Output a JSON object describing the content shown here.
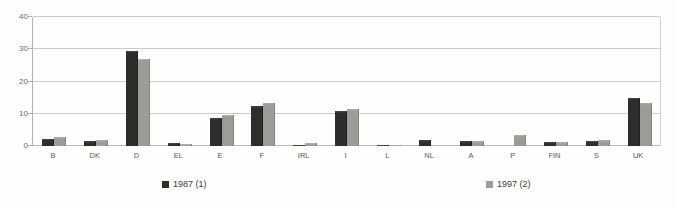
{
  "chart_data": {
    "type": "bar",
    "title": "",
    "xlabel": "",
    "ylabel": "",
    "categories": [
      "B",
      "DK",
      "D",
      "EL",
      "E",
      "F",
      "IRL",
      "I",
      "L",
      "NL",
      "A",
      "P",
      "FIN",
      "S",
      "UK"
    ],
    "series": [
      {
        "name": "1987 (1)",
        "color": "#2e2d2b",
        "values": [
          2.2,
          1.4,
          29.5,
          0.9,
          8.8,
          12.3,
          0.4,
          10.8,
          0.2,
          2.0,
          1.5,
          0,
          1.1,
          1.7,
          14.8
        ]
      },
      {
        "name": "1997 (2)",
        "color": "#9b9b98",
        "values": [
          2.8,
          1.8,
          27.0,
          0.6,
          9.6,
          13.2,
          0.8,
          11.5,
          0.3,
          0,
          1.4,
          3.3,
          1.3,
          1.8,
          13.4
        ]
      }
    ],
    "ylim": [
      0,
      40
    ],
    "yticks": [
      0,
      10,
      20,
      30,
      40
    ],
    "grid": true,
    "legend_position": "bottom"
  },
  "colors": {
    "series_1987": "#2e2d2b",
    "series_1997": "#9b9b98",
    "gridline": "#cbcbc8",
    "background": "#fdfdfb"
  }
}
